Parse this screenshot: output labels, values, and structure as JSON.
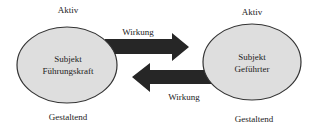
{
  "diagram": {
    "left_node": {
      "top_label": "Aktiv",
      "line1": "Subjekt",
      "line2": "Führungskraft",
      "bottom_label": "Gestaltend"
    },
    "right_node": {
      "top_label": "Aktiv",
      "line1": "Subjekt",
      "line2": "Geführter",
      "bottom_label": "Gestaltend"
    },
    "arrows": [
      {
        "direction": "left-to-right",
        "label": "Wirkung"
      },
      {
        "direction": "right-to-left",
        "label": "Wirkung"
      }
    ],
    "colors": {
      "ellipse_fill": "#dedede",
      "ellipse_stroke": "#333333",
      "arrow_fill": "#262626"
    }
  }
}
